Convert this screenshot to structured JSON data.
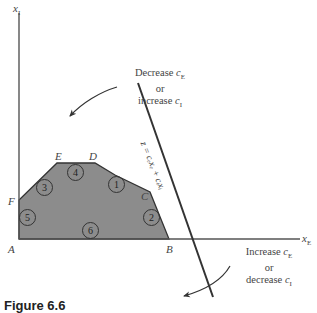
{
  "figure": {
    "caption": "Figure 6.6",
    "axes": {
      "y_label": "x",
      "y_label_sub": "I",
      "x_label": "x",
      "x_label_sub": "E"
    },
    "vertices": [
      {
        "id": "A",
        "label": "A"
      },
      {
        "id": "B",
        "label": "B"
      },
      {
        "id": "C",
        "label": "C"
      },
      {
        "id": "D",
        "label": "D"
      },
      {
        "id": "E",
        "label": "E"
      },
      {
        "id": "F",
        "label": "F"
      }
    ],
    "constraints": [
      {
        "id": "1",
        "label": "1"
      },
      {
        "id": "2",
        "label": "2"
      },
      {
        "id": "3",
        "label": "3"
      },
      {
        "id": "4",
        "label": "4"
      },
      {
        "id": "5",
        "label": "5"
      },
      {
        "id": "6",
        "label": "6"
      }
    ],
    "objective_line": {
      "label": "z = cₑxₑ + cᵢxᵢ",
      "label_text": "z = cExE + cIxI"
    },
    "annotations": {
      "upper": {
        "line1": "Decrease ",
        "line1_var": "c",
        "line1_sub": "E",
        "line2": "or",
        "line3": "increase ",
        "line3_var": "c",
        "line3_sub": "I"
      },
      "lower": {
        "line1": "Increase ",
        "line1_var": "c",
        "line1_sub": "E",
        "line2": "or",
        "line3": "decrease ",
        "line3_var": "c",
        "line3_sub": "I"
      }
    },
    "colors": {
      "feasible_region": "#8c8c8c",
      "lines": "#333333",
      "background": "#ffffff"
    }
  }
}
